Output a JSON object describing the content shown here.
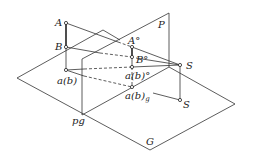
{
  "diagram": {
    "type": "perspective-projection",
    "planes": {
      "picture_plane": "P",
      "ground_plane": "G",
      "ground_line": "pg"
    },
    "labels": {
      "A": "A",
      "B": "B",
      "ab": "a(b)",
      "A_deg": "A°",
      "B_deg": "B°",
      "ab_deg": "a(b)°",
      "ab_g_main": "a(b)",
      "ab_g_sub": "g",
      "S_upper": "S",
      "S_lower": "S",
      "P": "P",
      "G": "G",
      "pg": "pg"
    },
    "colors": {
      "line": "#333333",
      "background": "#ffffff"
    }
  }
}
